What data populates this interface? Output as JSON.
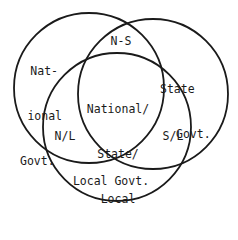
{
  "diagram": {
    "type": "venn",
    "stroke_color": "#1a1a1a",
    "background": "#ffffff",
    "circles": [
      {
        "id": "national",
        "cx": 89,
        "cy": 88,
        "r": 75
      },
      {
        "id": "state",
        "cx": 153,
        "cy": 94,
        "r": 75
      },
      {
        "id": "local",
        "cx": 117,
        "cy": 127,
        "r": 74
      }
    ],
    "labels": {
      "national_line1": "Nat-",
      "national_line2": "ional",
      "national_line3": "Govt.",
      "ns": "N-S",
      "state_line1": "State",
      "state_line2": "Govt.",
      "center_line1": "National/",
      "center_line2": "State/",
      "center_line3": "Local",
      "nl": "N/L",
      "sl": "S/L",
      "local": "Local Govt."
    }
  }
}
